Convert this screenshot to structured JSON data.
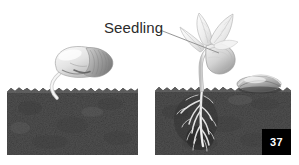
{
  "figure": {
    "background_color": "#ffffff",
    "width": 299,
    "height": 165
  },
  "annotations": {
    "seedling_label": "Seedling",
    "leader_line": {
      "from_x": 160,
      "from_y": 30,
      "to_x": 219,
      "to_y": 53,
      "color": "#8a8a8a"
    }
  },
  "page_badge": {
    "number": "37",
    "background_color": "#000000",
    "text_color": "#ffffff"
  },
  "panels": [
    {
      "name": "left-panel-germinating-seed",
      "soil_block": {
        "x": 7,
        "y": 87,
        "width": 131,
        "height": 68,
        "fill_color": "#4a4a4a",
        "top_edge": "jagged"
      },
      "subject": "germinating-seed",
      "subject_description": "Bean seed resting on soil surface with emerging radicle root entering the soil",
      "subject_color": "#e8e8e8"
    },
    {
      "name": "right-panel-seedling",
      "soil_block": {
        "x": 155,
        "y": 86,
        "width": 136,
        "height": 69,
        "fill_color": "#4a4a4a",
        "top_edge": "jagged"
      },
      "subject": "young-seedling",
      "subject_description": "Seedling with two unfolding leaves, curved hypocotyl hook, stem and branching taproot system below soil; discarded seed coat on soil surface at right",
      "subject_color": "#ededed"
    }
  ],
  "colors": {
    "soil_dark": "#3c3c3c",
    "soil_mid": "#5a5a5a",
    "soil_light": "#767676",
    "plant_light": "#f0f0f0",
    "plant_shade": "#bdbdbd",
    "plant_outline": "#9a9a9a",
    "label_text": "#2b2b2b"
  }
}
